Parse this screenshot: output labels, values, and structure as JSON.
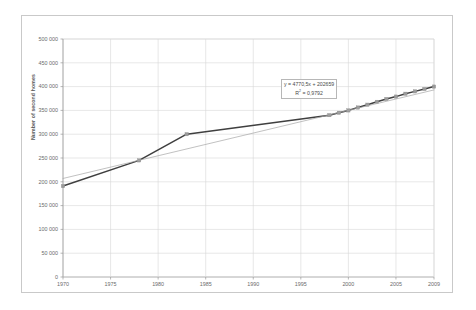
{
  "chart_data": {
    "type": "line",
    "title": "",
    "xlabel": "",
    "ylabel": "Number of second homes",
    "xlim": [
      1970,
      2009
    ],
    "ylim": [
      0,
      500000
    ],
    "grid": true,
    "legend": false,
    "x_ticks": [
      "1970",
      "1975",
      "1980",
      "1985",
      "1990",
      "1995",
      "2000",
      "2005",
      "2009"
    ],
    "x_tick_values": [
      1970,
      1975,
      1980,
      1985,
      1990,
      1995,
      2000,
      2005,
      2009
    ],
    "y_ticks": [
      "0",
      "50 000",
      "100 000",
      "150 000",
      "200 000",
      "250 000",
      "300 000",
      "350 000",
      "400 000",
      "450 000",
      "500 000"
    ],
    "y_tick_values": [
      0,
      50000,
      100000,
      150000,
      200000,
      250000,
      300000,
      350000,
      400000,
      450000,
      500000
    ],
    "series": [
      {
        "name": "Number of second homes",
        "color": "#3f3f3f",
        "marker": "square",
        "marker_color": "#9a9a9a",
        "x": [
          1970,
          1978,
          1983,
          1998,
          1999,
          2000,
          2001,
          2002,
          2003,
          2004,
          2005,
          2006,
          2007,
          2008,
          2009
        ],
        "values": [
          191000,
          245000,
          300000,
          340000,
          345000,
          350000,
          356000,
          362000,
          368000,
          374000,
          379000,
          385000,
          390000,
          395000,
          400000
        ]
      },
      {
        "name": "Linear trendline",
        "color": "#a6a6a6",
        "marker": "none",
        "x": [
          1970,
          2009
        ],
        "values": [
          207000,
          393000
        ]
      }
    ],
    "annotations": [
      {
        "name": "trendline-equation",
        "equation": "y = 4770,5x + 202659",
        "r_squared": "R² = 0,9792",
        "r_squared_label": "R",
        "r_squared_exp": "2",
        "r_squared_value": " = 0,9792"
      }
    ]
  }
}
